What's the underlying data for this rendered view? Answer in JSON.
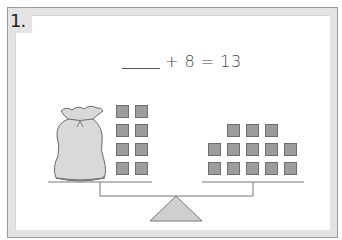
{
  "question": {
    "number": "1.",
    "equation_blank": "____",
    "equation_rest": "+ 8 = 13"
  },
  "left_pan": {
    "bag": "money-bag",
    "squares": 8,
    "layout": {
      "cols": 2,
      "rows": 4
    }
  },
  "right_pan": {
    "squares": 13,
    "rows": [
      3,
      5,
      5
    ]
  },
  "colors": {
    "square_fill": "#9c9c9c",
    "square_border": "#6f6f6f",
    "bag_fill": "#d9d9d9",
    "fulcrum_fill": "#cfcfcf",
    "frame_band": "#e4e4e4",
    "line": "#777777"
  }
}
